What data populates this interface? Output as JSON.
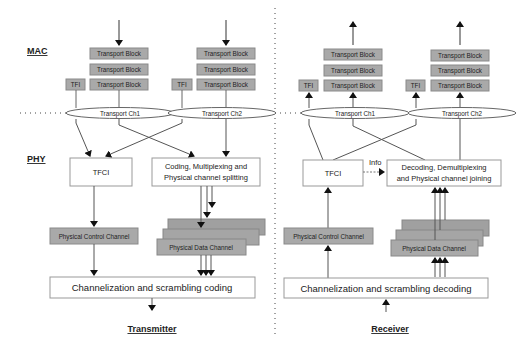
{
  "colors": {
    "block_fill": "#a9a9a9",
    "block_stroke": "#8a8a8a",
    "line": "#555555",
    "arrow": "#111111",
    "box_stroke": "#999999"
  },
  "layers": {
    "mac": "MAC",
    "phy": "PHY"
  },
  "transmitter": {
    "title": "Transmitter",
    "channels": [
      {
        "name": "Transport Ch1",
        "blocks": [
          "Transport Block",
          "Transport Block",
          "Transport Block"
        ],
        "tfi": "TFI"
      },
      {
        "name": "Transport Ch2",
        "blocks": [
          "Transport Block",
          "Transport Block",
          "Transport Block"
        ],
        "tfi": "TFI"
      }
    ],
    "tfci": "TFCI",
    "coding_line1": "Coding, Multiplexing and",
    "coding_line2": "Physical channel splitting",
    "control_channel": "Physical Control Channel",
    "data_channel": "Physical Data Channel",
    "channelization": "Channelization and scrambling coding"
  },
  "receiver": {
    "title": "Receiver",
    "channels": [
      {
        "name": "Transport Ch1",
        "blocks": [
          "Transport Block",
          "Transport Block",
          "Transport Block"
        ],
        "tfi": "TFI"
      },
      {
        "name": "Transport Ch2",
        "blocks": [
          "Transport Block",
          "Transport Block",
          "Transport Block"
        ],
        "tfi": "TFI"
      }
    ],
    "tfci": "TFCI",
    "info": "Info",
    "decoding_line1": "Decoding, Demultiplexing",
    "decoding_line2": "and Physical channel joining",
    "control_channel": "Physical Control Channel",
    "data_channel": "Physical Data Channel",
    "channelization": "Channelization and scrambling decoding"
  }
}
